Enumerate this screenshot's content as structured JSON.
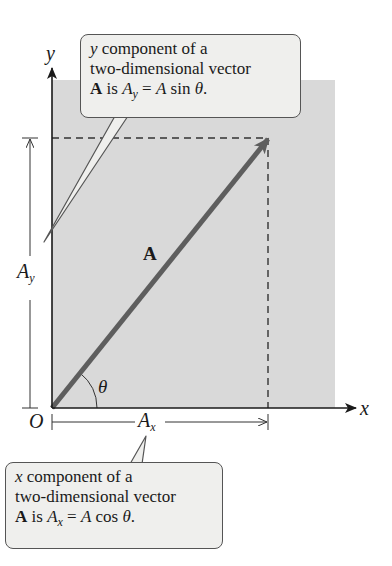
{
  "diagram": {
    "colors": {
      "background": "#ffffff",
      "shaded_region": "#d9d9d9",
      "vector": "#5e5e5e",
      "axis": "#1a1a1a",
      "callout_fill": "#efefed"
    },
    "axes": {
      "x_label": "x",
      "y_label": "y",
      "origin_label": "O"
    },
    "vector": {
      "label": "A",
      "angle_label": "θ"
    },
    "components": {
      "x_label_main": "A",
      "x_label_sub": "x",
      "y_label_main": "A",
      "y_label_sub": "y"
    },
    "callouts": {
      "y_component": {
        "line1_var": "y",
        "line1_text": " component of a",
        "line2": "two-dimensional vector",
        "line3_bold": "A",
        "line3_is": " is ",
        "line3_lhs": "A",
        "line3_lhs_sub": "y",
        "line3_eq": " = ",
        "line3_rhs_var": "A",
        "line3_func": " sin ",
        "line3_angle": "θ",
        "line3_end": "."
      },
      "x_component": {
        "line1_var": "x",
        "line1_text": " component of a",
        "line2": "two-dimensional vector",
        "line3_bold": "A",
        "line3_is": " is ",
        "line3_lhs": "A",
        "line3_lhs_sub": "x",
        "line3_eq": " = ",
        "line3_rhs_var": "A",
        "line3_func": " cos ",
        "line3_angle": "θ",
        "line3_end": "."
      }
    }
  }
}
